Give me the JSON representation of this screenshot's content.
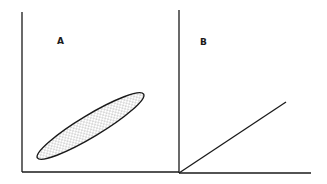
{
  "figure": {
    "panels": [
      {
        "label": "A",
        "shape": "dotted-ellipse",
        "description": "elongated shaded ellipse tilted upward from lower-left to upper-right"
      },
      {
        "label": "B",
        "shape": "straight-line",
        "description": "straight line starting at origin rising toward upper-right"
      }
    ]
  },
  "colors": {
    "ink": "#1a1a1a",
    "background": "#ffffff",
    "dots": "#555555"
  }
}
